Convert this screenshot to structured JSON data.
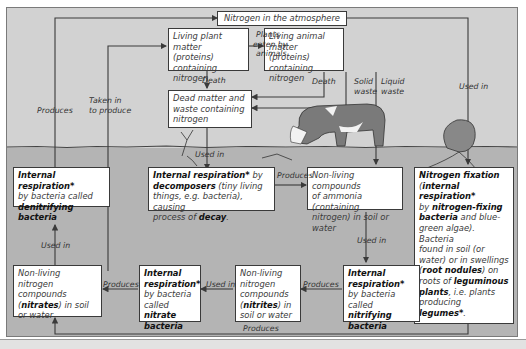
{
  "diagram": {
    "nodes": {
      "atmosphere": {
        "text": "Nitrogen in the atmosphere"
      },
      "plant_matter": {
        "l1": "Living plant matter",
        "l2": "(proteins) containing",
        "l3": "nitrogen"
      },
      "animal_matter": {
        "l1": "Living animal",
        "l2": "matter (proteins)",
        "l3": "containing nitrogen"
      },
      "dead_matter": {
        "l1": "Dead matter and",
        "l2": "waste containing",
        "l3": "nitrogen"
      },
      "denitrifying": {
        "b1": "Internal respiration*",
        "l2": "by bacteria called",
        "b3": "denitrifying bacteria"
      },
      "decomposers": {
        "b1": "Internal respiration*",
        "t1": " by",
        "b2": "decomposers",
        "t2": " (tiny living",
        "l3": "things, e.g. bacteria), causing",
        "t4": "process of ",
        "b4": "decay",
        "t4b": "."
      },
      "ammonia": {
        "l1": "Non-living compounds",
        "l2": "of ammonia (containing",
        "l3": "nitrogen) in soil or water"
      },
      "fixation": {
        "b1": "Nitrogen fixation",
        "t2a": "(",
        "b2": "internal respiration*",
        "t3": "by ",
        "b3": "nitrogen-fixing",
        "b4": "bacteria",
        "t4": " and blue-",
        "l5": "green algae). Bacteria",
        "l6": "found in soil (or",
        "l7": "water) or in swellings",
        "t8a": "(",
        "b8": "root nodules",
        "t8b": ") on",
        "t9": "roots of ",
        "b9": "leguminous",
        "b10": "plants",
        "t10": ", i.e. plants",
        "t11": "producing ",
        "b11": "legumes*",
        "t11b": "."
      },
      "nitrates": {
        "l1": "Non-living nitrogen",
        "l2": "compounds",
        "t3a": "(",
        "b3": "nitrates",
        "t3b": ") in soil",
        "l4": "or water"
      },
      "nitrate_bacteria": {
        "b1": "Internal",
        "b2": "respiration*",
        "l3": "by bacteria",
        "t4": "called ",
        "b4": "nitrate",
        "b5": "bacteria"
      },
      "nitrites": {
        "l1": "Non-living",
        "l2": "nitrogen",
        "l3": "compounds",
        "t4a": "(",
        "b4": "nitrites",
        "t4b": ") in",
        "l5": "soil or water"
      },
      "nitrifying": {
        "b1": "Internal",
        "b2": "respiration*",
        "l3": "by bacteria called",
        "b4": "nitrifying",
        "b5": "bacteria"
      }
    },
    "edge_labels": {
      "plants_eaten": {
        "l1": "Plants",
        "l2": "eaten by",
        "l3": "animals"
      },
      "death_plant": "Death",
      "death_animal": "Death",
      "solid_waste": {
        "l1": "Solid",
        "l2": "waste"
      },
      "liquid_waste": {
        "l1": "Liquid",
        "l2": "waste"
      },
      "used_in_fixation": "Used in",
      "used_in_decomposers": "Used in",
      "produces_atmosphere": "Produces",
      "taken_in": {
        "l1": "Taken in",
        "l2": "to produce"
      },
      "produces_ammonia": "Produces",
      "used_in_nitrifying": "Used in",
      "produces_nitrites": "Produces",
      "used_in_nitrate_bacteria": "Used in",
      "produces_nitrates": "Produces",
      "used_in_denitrifying": "Used in",
      "produces_bottom": "Produces"
    },
    "colors": {
      "sky": "#d2d2d2",
      "soil": "#b4b4b4",
      "box_fill": "#ffffff",
      "line": "#3a3a3a"
    }
  }
}
